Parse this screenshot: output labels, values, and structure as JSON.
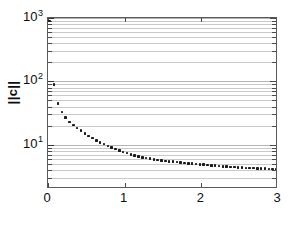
{
  "chart_data": {
    "type": "scatter",
    "title": "",
    "xlabel": "",
    "ylabel": "||c||",
    "ylabel_parts": {
      "bar_left": "||",
      "symbol": "c",
      "bar_right": "||"
    },
    "xlim": [
      0,
      3
    ],
    "ylim": [
      2,
      1000
    ],
    "yscale": "log",
    "xscale": "linear",
    "grid": true,
    "grid_axis": "y",
    "grid_minor": true,
    "legend": null,
    "xticks": [
      0,
      1,
      2,
      3
    ],
    "xtick_labels": [
      "0",
      "1",
      "2",
      "3"
    ],
    "yticks": [
      10,
      100,
      1000
    ],
    "ytick_labels": [
      {
        "mantissa": "10",
        "exponent": "1"
      },
      {
        "mantissa": "10",
        "exponent": "2"
      },
      {
        "mantissa": "10",
        "exponent": "3"
      }
    ],
    "marker": "square",
    "marker_color": "#1a1a1a",
    "marker_size": 2.6,
    "grid_color": "#c9c9c9",
    "axis_color": "#5a5a5a",
    "background": "#ffffff",
    "series": [
      {
        "name": "||c||",
        "x": [
          0.02,
          0.08,
          0.13,
          0.18,
          0.23,
          0.28,
          0.33,
          0.38,
          0.43,
          0.48,
          0.53,
          0.58,
          0.63,
          0.68,
          0.73,
          0.78,
          0.83,
          0.88,
          0.93,
          0.98,
          1.03,
          1.08,
          1.13,
          1.18,
          1.23,
          1.28,
          1.33,
          1.38,
          1.43,
          1.48,
          1.53,
          1.58,
          1.63,
          1.68,
          1.73,
          1.78,
          1.83,
          1.88,
          1.93,
          1.98,
          2.03,
          2.08,
          2.13,
          2.18,
          2.23,
          2.28,
          2.33,
          2.38,
          2.43,
          2.48,
          2.53,
          2.58,
          2.63,
          2.68,
          2.73,
          2.78,
          2.83,
          2.88,
          2.93,
          2.98
        ],
        "y": [
          900,
          90,
          45,
          33,
          27,
          23,
          20.5,
          18.4,
          16.6,
          15.1,
          13.8,
          12.7,
          11.7,
          10.9,
          10.2,
          9.6,
          9.0,
          8.5,
          8.1,
          7.7,
          7.35,
          7.05,
          6.8,
          6.55,
          6.35,
          6.18,
          6.02,
          5.88,
          5.76,
          5.65,
          5.55,
          5.46,
          5.38,
          5.3,
          5.22,
          5.15,
          5.08,
          5.01,
          4.95,
          4.89,
          4.83,
          4.77,
          4.71,
          4.66,
          4.61,
          4.56,
          4.51,
          4.47,
          4.43,
          4.39,
          4.35,
          4.32,
          4.29,
          4.26,
          4.23,
          4.2,
          4.18,
          4.16,
          4.14,
          4.12
        ]
      }
    ],
    "gridline_values": [
      3,
      4,
      5,
      6,
      7,
      8,
      9,
      10,
      20,
      30,
      40,
      50,
      60,
      70,
      80,
      90,
      100,
      200,
      300,
      400,
      500,
      600,
      700,
      800,
      900,
      1000
    ],
    "minor_tick_values": [
      3,
      4,
      5,
      6,
      7,
      8,
      9,
      20,
      30,
      40,
      50,
      60,
      70,
      80,
      90,
      200,
      300,
      400,
      500,
      600,
      700,
      800,
      900
    ]
  },
  "figure": {
    "width": 289,
    "height": 226
  }
}
